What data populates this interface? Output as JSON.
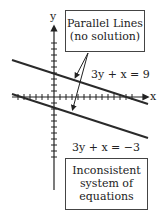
{
  "axes": {
    "x_label": "x",
    "y_label": "y"
  },
  "callout_top": {
    "line1": "Parallel Lines",
    "line2": "(no solution)"
  },
  "equations": {
    "upper": "3y + x = 9",
    "lower": "3y + x = −3"
  },
  "callout_bottom": {
    "line1": "Inconsistent",
    "line2": "system of",
    "line3": "equations"
  },
  "colors": {
    "line": "#2a2a2a",
    "box_border": "#444444"
  }
}
